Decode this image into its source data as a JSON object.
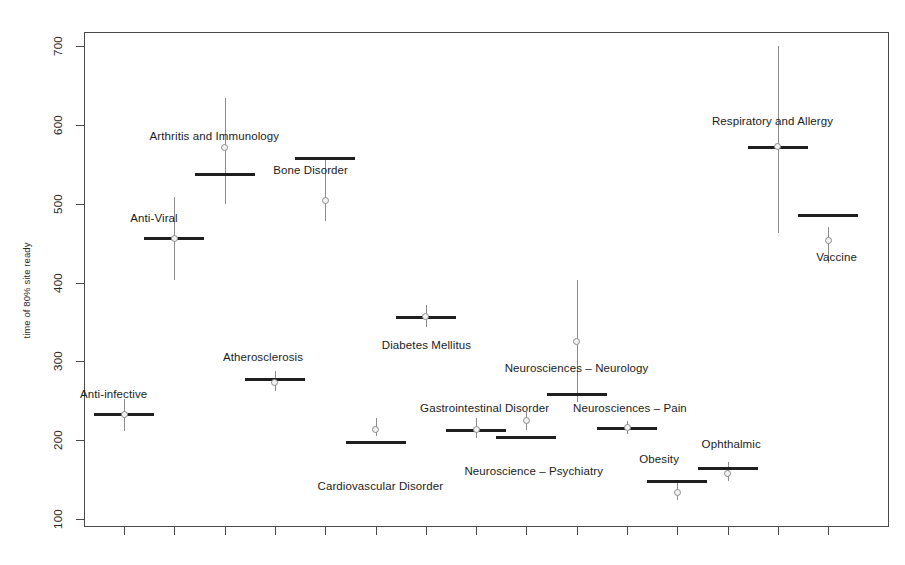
{
  "chart_data": {
    "type": "scatter",
    "title": "",
    "xlabel": "",
    "ylabel": "time of 80% site ready",
    "ylim": [
      60,
      740
    ],
    "yticks": [
      100,
      200,
      300,
      400,
      500,
      600,
      700
    ],
    "ytick_labels": [
      "100",
      "200",
      "300",
      "400",
      "500",
      "600",
      "700"
    ],
    "grid": false,
    "legend": "none",
    "xtick_labels": [
      "",
      "",
      "",
      "",
      "",
      "",
      "",
      "",
      "",
      "",
      "",
      "",
      "",
      "",
      ""
    ],
    "categories": [
      "Anti-infective",
      "Anti-Viral",
      "Arthritis and Immunology",
      "Atherosclerosis",
      "Bone Disorder",
      "Cardiovascular Disorder",
      "Diabetes Mellitus",
      "Gastrointestinal Disorder",
      "Neuroscience – Psychiatry",
      "Neurosciences – Neurology",
      "Neurosciences – Pain",
      "Obesity",
      "Ophthalmic",
      "Respiratory and Allergy",
      "Vaccine"
    ],
    "series": [
      {
        "name": "point estimate",
        "values": [
          233,
          456,
          571,
          273,
          504,
          213,
          357,
          214,
          225,
          325,
          216,
          134,
          158,
          573,
          453
        ]
      },
      {
        "name": "bar (median/threshold)",
        "values": [
          233,
          456,
          538,
          277,
          558,
          198,
          356,
          213,
          204,
          259,
          216,
          148,
          165,
          572,
          485
        ]
      },
      {
        "name": "lower whisker",
        "values": [
          211,
          403,
          500,
          262,
          478,
          205,
          343,
          203,
          213,
          248,
          208,
          124,
          148,
          463,
          425
        ]
      },
      {
        "name": "upper whisker",
        "values": [
          252,
          509,
          634,
          288,
          558,
          228,
          372,
          228,
          240,
          403,
          224,
          147,
          172,
          700,
          470
        ]
      }
    ],
    "annotations": [
      {
        "text": "Anti-infective",
        "category_index": 0
      },
      {
        "text": "Anti-Viral",
        "category_index": 1
      },
      {
        "text": "Arthritis and Immunology",
        "category_index": 2
      },
      {
        "text": "Atherosclerosis",
        "category_index": 3
      },
      {
        "text": "Bone Disorder",
        "category_index": 4
      },
      {
        "text": "Cardiovascular Disorder",
        "category_index": 5
      },
      {
        "text": "Diabetes Mellitus",
        "category_index": 6
      },
      {
        "text": "Gastrointestinal Disorder",
        "category_index": 7
      },
      {
        "text": "Neuroscience – Psychiatry",
        "category_index": 8
      },
      {
        "text": "Neurosciences – Neurology",
        "category_index": 9
      },
      {
        "text": "Neurosciences – Pain",
        "category_index": 10
      },
      {
        "text": "Obesity",
        "category_index": 11
      },
      {
        "text": "Ophthalmic",
        "category_index": 12
      },
      {
        "text": "Respiratory and Allergy",
        "category_index": 13
      },
      {
        "text": "Vaccine",
        "category_index": 14
      }
    ]
  },
  "layout": {
    "plot_left": 84,
    "plot_top": 32,
    "plot_width": 805,
    "plot_height": 495,
    "y_pixel_at_100": 519,
    "y_pixel_at_700": 46,
    "x_first_tick": 124,
    "x_tick_step": 50.3,
    "label_offsets": [
      {
        "dx": -44,
        "dy": -26
      },
      {
        "dx": -44,
        "dy": -26
      },
      {
        "dx": -75,
        "dy": -44
      },
      {
        "dx": -52,
        "dy": -28
      },
      {
        "dx": -52,
        "dy": 6
      },
      {
        "dx": -58,
        "dy": 38
      },
      {
        "dx": -44,
        "dy": 22
      },
      {
        "dx": -56,
        "dy": -28
      },
      {
        "dx": -62,
        "dy": 28
      },
      {
        "dx": -72,
        "dy": -32
      },
      {
        "dx": -54,
        "dy": -26
      },
      {
        "dx": -38,
        "dy": -28
      },
      {
        "dx": -26,
        "dy": -30
      },
      {
        "dx": -66,
        "dy": -32
      },
      {
        "dx": -12,
        "dy": 36
      }
    ]
  },
  "colors": {
    "axis": "#4a4a4a",
    "bar": "#1f1f1f",
    "whisker": "#8c8c8c",
    "point_edge": "#8c8c8c",
    "point_fill": "#f2f2f2",
    "text": "#1c1c1c",
    "background": "#ffffff"
  }
}
